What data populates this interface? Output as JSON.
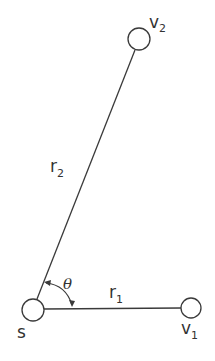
{
  "diagram": {
    "type": "geometry",
    "colors": {
      "stroke": "#3a3a3a",
      "text": "#333333",
      "background": "#ffffff"
    },
    "nodes": [
      {
        "id": "s",
        "label": "s",
        "subscript": "",
        "x": 33,
        "y": 310,
        "r": 11
      },
      {
        "id": "v1",
        "label": "v",
        "subscript": "1",
        "x": 191,
        "y": 308,
        "r": 10
      },
      {
        "id": "v2",
        "label": "v",
        "subscript": "2",
        "x": 139,
        "y": 39,
        "r": 11
      }
    ],
    "edges": [
      {
        "id": "r1",
        "from": "s",
        "to": "v1",
        "label": "r",
        "subscript": "1"
      },
      {
        "id": "r2",
        "from": "s",
        "to": "v2",
        "label": "r",
        "subscript": "2"
      }
    ],
    "angle": {
      "label": "θ",
      "between": [
        "r1",
        "r2"
      ],
      "vertex": "s",
      "double_arrow": true
    }
  }
}
